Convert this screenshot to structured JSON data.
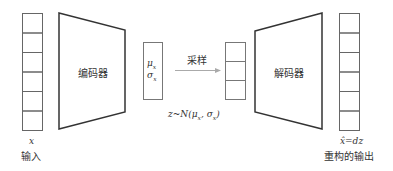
{
  "diagram": {
    "input": {
      "symbol": "x",
      "label": "输入",
      "cells": 6
    },
    "encoder": {
      "label": "编码器"
    },
    "latent_params": {
      "mu": "μ",
      "mu_sub": "x",
      "sigma": "σ",
      "sigma_sub": "x"
    },
    "sampling": {
      "label": "采样"
    },
    "latent_z": {
      "cells": 3
    },
    "distribution": {
      "text": "z~N(μ",
      "sub1": "x",
      "mid": ", σ",
      "sub2": "x",
      "close": ")"
    },
    "decoder": {
      "label": "解码器"
    },
    "output": {
      "symbol": "x̂=dz",
      "label": "重构的输出",
      "cells": 6
    },
    "colors": {
      "stroke": "#333333",
      "cell_stroke": "#666666",
      "arrow": "#999999"
    }
  }
}
